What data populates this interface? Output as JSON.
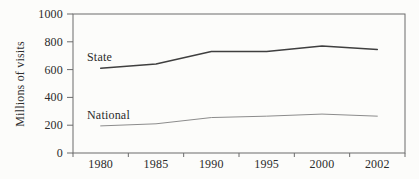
{
  "chart_data": {
    "type": "line",
    "title": "",
    "xlabel": "",
    "ylabel": "Millions of visits",
    "categories": [
      "1980",
      "1985",
      "1990",
      "1995",
      "2000",
      "2002"
    ],
    "series": [
      {
        "name": "State",
        "values": [
          610,
          640,
          730,
          730,
          770,
          745
        ],
        "color": "#3f3f3f",
        "width": 1.4
      },
      {
        "name": "National",
        "values": [
          195,
          210,
          255,
          265,
          280,
          265
        ],
        "color": "#8c8c8c",
        "width": 1.0
      }
    ],
    "ylim": [
      0,
      1000
    ],
    "yticks": [
      0,
      200,
      400,
      600,
      800,
      1000
    ],
    "grid": false,
    "legend_position": "inline-labels-near-first-point",
    "plot_border": "box",
    "axis_color": "#6b6b6b",
    "text_color": "#2b2b2b",
    "background_color": "#fcfcfa"
  }
}
